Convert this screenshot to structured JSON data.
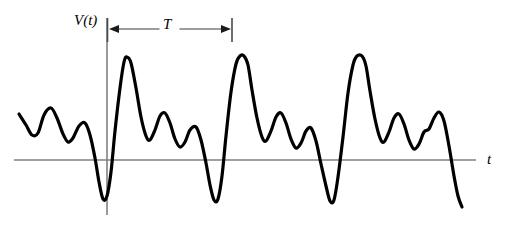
{
  "figure": {
    "title": "",
    "background_color": "#ffffff",
    "width": 508,
    "height": 238
  },
  "labels": {
    "vertical_axis": "V(t)",
    "horizontal_axis": "t",
    "period": "T"
  },
  "colors": {
    "curve": "#000000",
    "axis": "#808080",
    "annotation": "#000000",
    "text": "#000000"
  },
  "axes": {
    "horizontal": {
      "x_start": 14,
      "x_end": 476,
      "y": 160,
      "color": "#808080"
    },
    "vertical": {
      "x": 107,
      "y_start": 18,
      "y_end": 215,
      "color": "#808080"
    }
  },
  "annotation": {
    "period_measure": {
      "label": "T",
      "left_x": 107,
      "right_x": 232,
      "y": 29,
      "left_arrow": true,
      "right_arrow": true,
      "end_bars": true
    }
  },
  "chart_data": {
    "type": "line",
    "title": "",
    "xlabel": "t",
    "ylabel": "V(t)",
    "legend": null,
    "grid": false,
    "xlim": [
      0,
      508
    ],
    "ylim": [
      238,
      0
    ],
    "period_pixels": 122,
    "baseline_y": 160,
    "series": [
      {
        "name": "V(t)",
        "color": "#000000",
        "line_width": 3.2,
        "points": [
          [
            19,
            114
          ],
          [
            26,
            125
          ],
          [
            32,
            135
          ],
          [
            38,
            133
          ],
          [
            44,
            115
          ],
          [
            51,
            108
          ],
          [
            57,
            118
          ],
          [
            63,
            134
          ],
          [
            68,
            142
          ],
          [
            73,
            138
          ],
          [
            79,
            126
          ],
          [
            85,
            123
          ],
          [
            90,
            135
          ],
          [
            95,
            158
          ],
          [
            99,
            182
          ],
          [
            103,
            199
          ],
          [
            107,
            196
          ],
          [
            111,
            172
          ],
          [
            115,
            131
          ],
          [
            120,
            88
          ],
          [
            124,
            62
          ],
          [
            127,
            57
          ],
          [
            131,
            63
          ],
          [
            136,
            88
          ],
          [
            141,
            117
          ],
          [
            146,
            136
          ],
          [
            150,
            140
          ],
          [
            155,
            130
          ],
          [
            160,
            116
          ],
          [
            165,
            113
          ],
          [
            170,
            123
          ],
          [
            175,
            139
          ],
          [
            180,
            147
          ],
          [
            185,
            142
          ],
          [
            190,
            130
          ],
          [
            196,
            127
          ],
          [
            201,
            140
          ],
          [
            206,
            163
          ],
          [
            210,
            185
          ],
          [
            214,
            200
          ],
          [
            218,
            199
          ],
          [
            222,
            176
          ],
          [
            226,
            136
          ],
          [
            231,
            92
          ],
          [
            236,
            64
          ],
          [
            240,
            56
          ],
          [
            244,
            56
          ],
          [
            248,
            65
          ],
          [
            252,
            90
          ],
          [
            257,
            118
          ],
          [
            262,
            137
          ],
          [
            266,
            141
          ],
          [
            271,
            131
          ],
          [
            276,
            117
          ],
          [
            281,
            113
          ],
          [
            286,
            123
          ],
          [
            291,
            139
          ],
          [
            296,
            148
          ],
          [
            301,
            143
          ],
          [
            306,
            131
          ],
          [
            311,
            128
          ],
          [
            316,
            141
          ],
          [
            321,
            164
          ],
          [
            326,
            186
          ],
          [
            330,
            201
          ],
          [
            334,
            200
          ],
          [
            338,
            177
          ],
          [
            343,
            137
          ],
          [
            348,
            93
          ],
          [
            353,
            65
          ],
          [
            357,
            56
          ],
          [
            362,
            56
          ],
          [
            366,
            66
          ],
          [
            370,
            91
          ],
          [
            375,
            119
          ],
          [
            380,
            138
          ],
          [
            384,
            142
          ],
          [
            389,
            132
          ],
          [
            394,
            118
          ],
          [
            399,
            114
          ],
          [
            404,
            124
          ],
          [
            409,
            140
          ],
          [
            414,
            149
          ],
          [
            419,
            144
          ],
          [
            424,
            132
          ],
          [
            429,
            129
          ],
          [
            434,
            118
          ],
          [
            439,
            112
          ],
          [
            444,
            121
          ],
          [
            449,
            146
          ],
          [
            454,
            176
          ],
          [
            458,
            196
          ],
          [
            462,
            207
          ]
        ]
      }
    ],
    "annotations": [
      {
        "type": "period-span",
        "label": "T",
        "from_x": 107,
        "to_x": 232,
        "y": 29
      },
      {
        "type": "axis-label",
        "text": "V(t)",
        "x": 74,
        "y": 13
      },
      {
        "type": "axis-label",
        "text": "t",
        "x": 487,
        "y": 152
      }
    ]
  }
}
